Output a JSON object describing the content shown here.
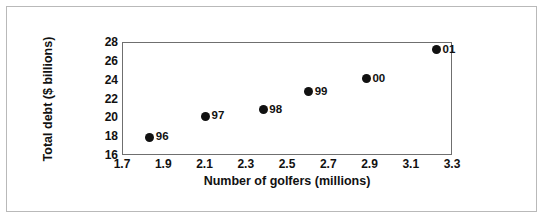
{
  "chart_data": {
    "type": "scatter",
    "title": "",
    "xlabel": "Number of golfers (millions)",
    "ylabel": "Total debt ($ billions)",
    "xlim": [
      1.7,
      3.3
    ],
    "ylim": [
      16,
      28
    ],
    "xticks": [
      "1.7",
      "1.9",
      "2.1",
      "2.3",
      "2.5",
      "2.7",
      "2.9",
      "3.1",
      "3.3"
    ],
    "yticks": [
      "16",
      "18",
      "20",
      "22",
      "24",
      "26",
      "28"
    ],
    "grid": false,
    "legend": "none",
    "marker_color": "#111111",
    "frame_color": "#6f6f6f",
    "points": [
      {
        "label": "96",
        "x": 1.83,
        "y": 18.0
      },
      {
        "label": "97",
        "x": 2.1,
        "y": 20.2
      },
      {
        "label": "98",
        "x": 2.38,
        "y": 20.9
      },
      {
        "label": "99",
        "x": 2.6,
        "y": 22.8
      },
      {
        "label": "00",
        "x": 2.88,
        "y": 24.2
      },
      {
        "label": "01",
        "x": 3.22,
        "y": 27.3
      }
    ]
  }
}
